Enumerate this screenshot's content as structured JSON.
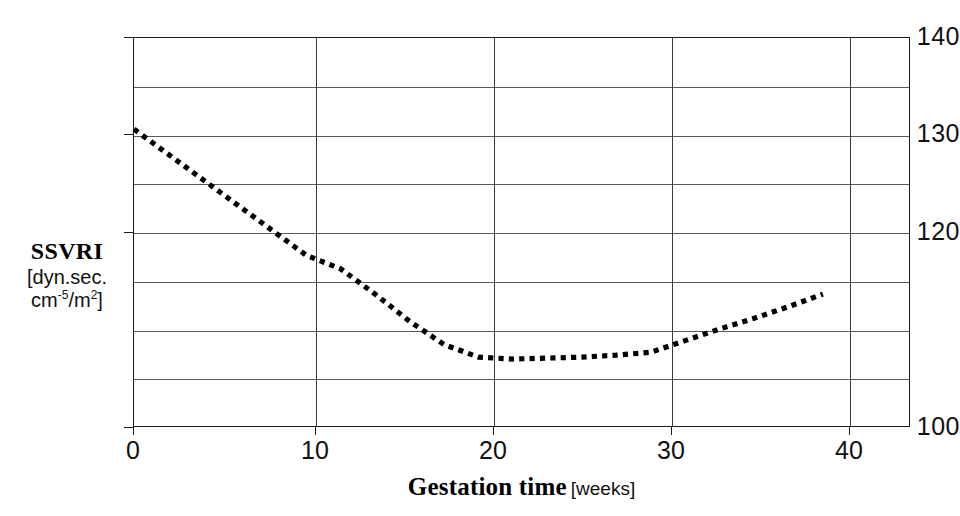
{
  "chart_data": {
    "type": "line",
    "title": "",
    "xlabel": "Gestation time",
    "xlabel_units": "[weeks]",
    "ylabel": "SSVRI",
    "ylabel_units_line1": "[dyn.sec.",
    "ylabel_units_line2_prefix": "cm",
    "ylabel_units_line2_sup1": "-5",
    "ylabel_units_line2_mid": "/m",
    "ylabel_units_line2_sup2": "2",
    "ylabel_units_line2_suffix": "]",
    "xlim": [
      0,
      45
    ],
    "ylim": [
      100,
      140
    ],
    "x_ticks": [
      0,
      10,
      20,
      30,
      40
    ],
    "x_tick_labels": [
      "0",
      "10",
      "20",
      "30",
      "40"
    ],
    "y_ticks": [
      100,
      120,
      130,
      140
    ],
    "y_tick_labels": [
      "100",
      "120",
      "130",
      "140"
    ],
    "y_gridlines": [
      105,
      110,
      115,
      120,
      125,
      130,
      135
    ],
    "x_gridlines": [
      10,
      20,
      30,
      40
    ],
    "grid": true,
    "legend": false,
    "line_style": "dotted",
    "line_color": "#000000",
    "line_width": 5,
    "series": [
      {
        "name": "SSVRI",
        "x": [
          0,
          2,
          4,
          6,
          8,
          10,
          12,
          14,
          16,
          18,
          20,
          22,
          24,
          26,
          28,
          30,
          32,
          34,
          36,
          38,
          40
        ],
        "values": [
          130.6,
          128.0,
          125.4,
          122.8,
          120.2,
          117.6,
          116.2,
          113.6,
          110.8,
          108.4,
          107.1,
          106.9,
          107.0,
          107.1,
          107.3,
          107.6,
          108.8,
          110.0,
          111.1,
          112.3,
          113.6
        ]
      }
    ]
  }
}
